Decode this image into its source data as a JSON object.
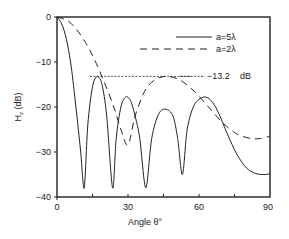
{
  "chart_data": {
    "type": "line",
    "title": "",
    "xlabel": "Angle θ°",
    "ylabel": "Hz (dB)",
    "xlim": [
      0,
      90
    ],
    "ylim": [
      -40,
      0
    ],
    "x_ticks": [
      "0",
      "30",
      "60",
      "90"
    ],
    "y_ticks": [
      "0",
      "−10",
      "−20",
      "−30",
      "−40"
    ],
    "grid": false,
    "legend_position": "upper right (inside)",
    "series": [
      {
        "name": "a=5λ",
        "style": "solid",
        "x": [
          0,
          2,
          4,
          6,
          8,
          10,
          11.5,
          13,
          15,
          17,
          19,
          21,
          23.5,
          25,
          27,
          29,
          31,
          33,
          35,
          37.5,
          40,
          43,
          46,
          49,
          51,
          53,
          55,
          58,
          62,
          65,
          68,
          72,
          76,
          80,
          84,
          88,
          90
        ],
        "y": [
          0,
          -1.5,
          -5,
          -11,
          -20,
          -30,
          -38,
          -24,
          -15.5,
          -13.2,
          -15,
          -22,
          -38,
          -27,
          -20,
          -17.8,
          -18.5,
          -22,
          -27,
          -38,
          -27,
          -21.5,
          -20.5,
          -22,
          -27,
          -35,
          -25,
          -19.5,
          -17.8,
          -18.5,
          -21,
          -26,
          -30.5,
          -33.5,
          -34.8,
          -35,
          -34.8
        ]
      },
      {
        "name": "a=2λ",
        "style": "dashed",
        "x": [
          0,
          5,
          10,
          15,
          20,
          24,
          27,
          30,
          33,
          37,
          40,
          43,
          47,
          52,
          58,
          64,
          70,
          76,
          82,
          86,
          90
        ],
        "y": [
          0,
          -1,
          -4,
          -8.5,
          -14.5,
          -20,
          -25,
          -28.5,
          -22,
          -16.5,
          -14.5,
          -13.5,
          -13.2,
          -14,
          -16.5,
          -20,
          -23.5,
          -26,
          -27,
          -27,
          -26.5
        ]
      },
      {
        "name": "-13.2 dB reference",
        "style": "dotted",
        "x": [
          14,
          57
        ],
        "y": [
          -13.2,
          -13.2
        ]
      }
    ],
    "annotations": [
      {
        "text": "−13.2",
        "x": 60,
        "y": -13.2
      },
      {
        "text": "dB",
        "x": 74,
        "y": -13.2
      }
    ]
  },
  "legend": {
    "items": [
      {
        "label": "a=5λ",
        "style": "solid"
      },
      {
        "label": "a=2λ",
        "style": "dashed"
      }
    ]
  },
  "annotation": {
    "value": "−13.2",
    "unit": "dB"
  },
  "axes": {
    "xlabel": "Angle  θ°",
    "ylabel_main": "H",
    "ylabel_sub": "z",
    "ylabel_unit": " (dB)",
    "x_ticks": [
      "0",
      "30",
      "60",
      "90"
    ],
    "y_ticks": [
      "0",
      "−10",
      "−20",
      "−30",
      "−40"
    ]
  }
}
